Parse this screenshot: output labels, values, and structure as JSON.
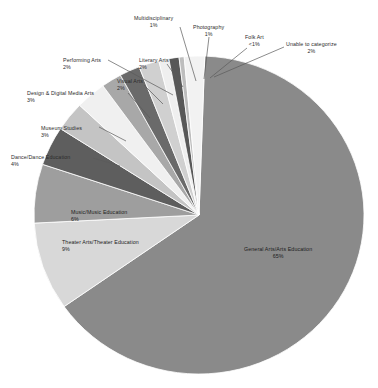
{
  "chart_data": {
    "type": "pie",
    "title": "",
    "subtitle": "",
    "xlabel": "",
    "ylabel": "",
    "legend_position": "none",
    "grid": false,
    "start_angle_deg": -88,
    "direction": "clockwise",
    "categories": [
      "General Arts/Arts Education",
      "Theater Arts/Theater Education",
      "Music/Music Education",
      "Dance/Dance Education",
      "Museum Studies",
      "Design & Digital Media Arts",
      "Visual Arts",
      "Literary Arts",
      "Performing Arts",
      "Multidisciplinary",
      "Photography",
      "Folk Art",
      "Unable to categorize"
    ],
    "values": [
      65,
      9,
      6,
      4,
      3,
      3,
      2,
      2,
      2,
      1,
      1,
      0.5,
      2
    ],
    "value_labels": [
      "65%",
      "9%",
      "6%",
      "4%",
      "3%",
      "3%",
      "2%",
      "2%",
      "2%",
      "1%",
      "1%",
      "<1%",
      "2%"
    ],
    "colors": [
      "#8a8a8a",
      "#d8d8d8",
      "#9e9e9e",
      "#5e5e5e",
      "#c4c4c4",
      "#f0f0f0",
      "#a8a8a8",
      "#6a6a6a",
      "#d0d0d0",
      "#efefef",
      "#585858",
      "#bdbdbd",
      "#f2f2f2"
    ]
  },
  "slices": [
    {
      "name": "General Arts/Arts Education",
      "pct": "65%",
      "label_x": 244,
      "label_y": 246,
      "align": "align-center",
      "placement": "on-slice",
      "leader": null
    },
    {
      "name": "Theater Arts/Theater Education",
      "pct": "9%",
      "label_x": 62,
      "label_y": 239,
      "align": "align-left",
      "placement": "on-slice",
      "leader": null
    },
    {
      "name": "Music/Music Education",
      "pct": "6%",
      "label_x": 71,
      "label_y": 209,
      "align": "align-left",
      "placement": "on-slice",
      "leader": null
    },
    {
      "name": "Dance/Dance Education",
      "pct": "4%",
      "label_x": 11,
      "label_y": 154,
      "align": "align-left",
      "placement": "outside",
      "leader": {
        "x1": 93,
        "y1": 158,
        "x2": 120,
        "y2": 166
      }
    },
    {
      "name": "Museum Studies",
      "pct": "3%",
      "label_x": 41,
      "label_y": 125,
      "align": "align-left",
      "placement": "outside",
      "leader": {
        "x1": 99,
        "y1": 127,
        "x2": 126,
        "y2": 141
      }
    },
    {
      "name": "Design & Digital Media Arts",
      "pct": "3%",
      "label_x": 27,
      "label_y": 90,
      "align": "align-left",
      "placement": "outside",
      "leader": {
        "x1": 128,
        "y1": 93,
        "x2": 150,
        "y2": 118
      }
    },
    {
      "name": "Visual Arts",
      "pct": "2%",
      "label_x": 117,
      "label_y": 78,
      "align": "align-left",
      "placement": "outside",
      "leader": {
        "x1": 144,
        "y1": 85,
        "x2": 163,
        "y2": 104
      }
    },
    {
      "name": "Literary Arts",
      "pct": "2%",
      "label_x": 139,
      "label_y": 57,
      "align": "align-left",
      "placement": "outside",
      "leader": {
        "x1": 167,
        "y1": 64,
        "x2": 183,
        "y2": 87
      }
    },
    {
      "name": "Performing Arts",
      "pct": "2%",
      "label_x": 63,
      "label_y": 57,
      "align": "align-left",
      "placement": "outside",
      "leader": {
        "x1": 108,
        "y1": 60,
        "x2": 173,
        "y2": 95
      }
    },
    {
      "name": "Multidisciplinary",
      "pct": "1%",
      "label_x": 134,
      "label_y": 15,
      "align": "align-center",
      "placement": "outside",
      "leader": {
        "x1": 180,
        "y1": 27,
        "x2": 196,
        "y2": 81
      }
    },
    {
      "name": "Photography",
      "pct": "1%",
      "label_x": 193,
      "label_y": 24,
      "align": "align-center",
      "placement": "outside",
      "leader": {
        "x1": 209,
        "y1": 37,
        "x2": 204,
        "y2": 79
      }
    },
    {
      "name": "Folk Art",
      "pct": "<1%",
      "label_x": 245,
      "label_y": 34,
      "align": "align-center",
      "placement": "outside",
      "leader": {
        "x1": 247,
        "y1": 48,
        "x2": 210,
        "y2": 78
      }
    },
    {
      "name": "Unable to categorize",
      "pct": "2%",
      "label_x": 286,
      "label_y": 41,
      "align": "align-center",
      "placement": "outside",
      "leader": {
        "x1": 284,
        "y1": 47,
        "x2": 214,
        "y2": 77
      }
    }
  ],
  "geometry": {
    "cx": 199,
    "cy": 215,
    "rx": 165,
    "ry": 159
  }
}
